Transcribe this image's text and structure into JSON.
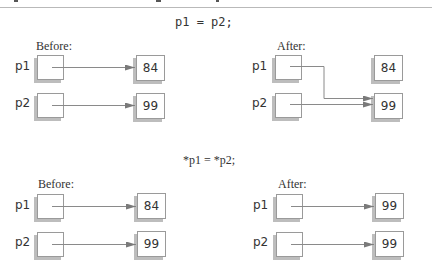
{
  "diagrams": [
    {
      "statement": "p1 = p2;",
      "before": {
        "label": "Before:",
        "pointers": [
          {
            "name": "p1",
            "target_value": "84"
          },
          {
            "name": "p2",
            "target_value": "99"
          }
        ],
        "values": [
          "84",
          "99"
        ]
      },
      "after": {
        "label": "After:",
        "pointers": [
          {
            "name": "p1",
            "target_value": "99"
          },
          {
            "name": "p2",
            "target_value": "99"
          }
        ],
        "values": [
          "84",
          "99"
        ]
      }
    },
    {
      "statement": "*p1 = *p2;",
      "before": {
        "label": "Before:",
        "pointers": [
          {
            "name": "p1",
            "target_value": "84"
          },
          {
            "name": "p2",
            "target_value": "99"
          }
        ],
        "values": [
          "84",
          "99"
        ]
      },
      "after": {
        "label": "After:",
        "pointers": [
          {
            "name": "p1",
            "target_value": "99"
          },
          {
            "name": "p2",
            "target_value": "99"
          }
        ],
        "values": [
          "99",
          "99"
        ]
      }
    }
  ],
  "colors": {
    "line": "#8a8a8a",
    "box_border": "#9a9a9a",
    "box_shadow": "#bdbdbd",
    "text": "#333333"
  }
}
